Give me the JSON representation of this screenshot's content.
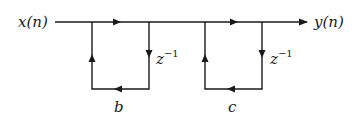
{
  "diagram": {
    "type": "signal-flow-graph",
    "input_label": "x(n)",
    "output_label": "y(n)",
    "sections": [
      {
        "delay_label": "z",
        "delay_exponent": "−1",
        "gain_label": "b"
      },
      {
        "delay_label": "z",
        "delay_exponent": "−1",
        "gain_label": "c"
      }
    ],
    "colors": {
      "line": "#1a1a1a",
      "background": "#ffffff"
    }
  }
}
